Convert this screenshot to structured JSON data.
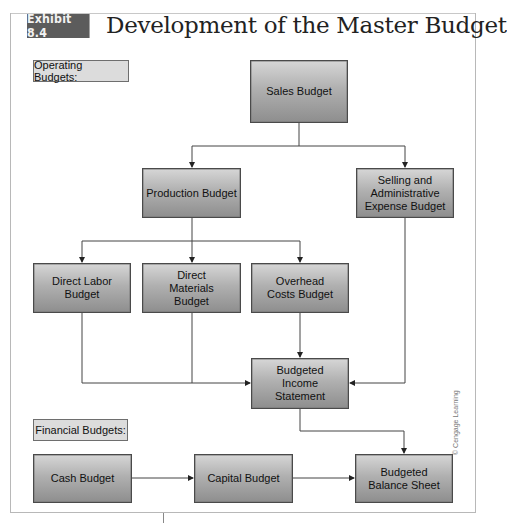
{
  "header": {
    "exhibit_label": "Exhibit 8.4",
    "title": "Development of the Master Budget"
  },
  "sections": {
    "operating": "Operating Budgets:",
    "financial": "Financial Budgets:"
  },
  "nodes": {
    "sales": "Sales Budget",
    "production": "Production Budget",
    "selling_admin": "Selling and\nAdministrative\nExpense Budget",
    "direct_labor": "Direct Labor\nBudget",
    "direct_materials": "Direct\nMaterials\nBudget",
    "overhead": "Overhead\nCosts Budget",
    "income_statement": "Budgeted\nIncome\nStatement",
    "cash": "Cash Budget",
    "capital": "Capital Budget",
    "balance_sheet": "Budgeted\nBalance Sheet"
  },
  "edges": [
    {
      "from": "Sales Budget",
      "to": "Production Budget"
    },
    {
      "from": "Sales Budget",
      "to": "Selling and Administrative Expense Budget"
    },
    {
      "from": "Production Budget",
      "to": "Direct Labor Budget"
    },
    {
      "from": "Production Budget",
      "to": "Direct Materials Budget"
    },
    {
      "from": "Production Budget",
      "to": "Overhead Costs Budget"
    },
    {
      "from": "Direct Labor Budget",
      "to": "Budgeted Income Statement"
    },
    {
      "from": "Direct Materials Budget",
      "to": "Budgeted Income Statement"
    },
    {
      "from": "Overhead Costs Budget",
      "to": "Budgeted Income Statement"
    },
    {
      "from": "Selling and Administrative Expense Budget",
      "to": "Budgeted Income Statement"
    },
    {
      "from": "Budgeted Income Statement",
      "to": "Budgeted Balance Sheet"
    },
    {
      "from": "Cash Budget",
      "to": "Capital Budget"
    },
    {
      "from": "Capital Budget",
      "to": "Budgeted Balance Sheet"
    }
  ],
  "credit": "© Cengage Learning",
  "colors": {
    "exhibit_tag_bg": "#5c5c5c",
    "box_gradient_top": "#d6d6d6",
    "box_gradient_bottom": "#8e8e8e",
    "section_label_bg": "#dcdcdc",
    "line": "#333333"
  }
}
